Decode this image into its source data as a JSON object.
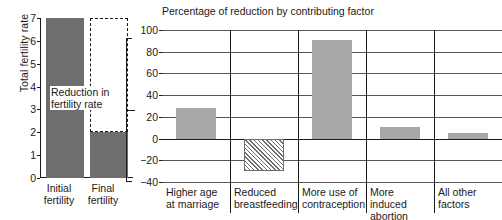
{
  "chart_data": [
    {
      "type": "bar",
      "panel": "left",
      "title": "",
      "xlabel": "",
      "ylabel": "Total fertility rate",
      "categories": [
        "Initial fertility",
        "Final fertility"
      ],
      "category_lines": [
        [
          "Initial",
          "fertility"
        ],
        [
          "Final",
          "fertility"
        ]
      ],
      "values": [
        7,
        2
      ],
      "ylim": [
        0,
        7
      ],
      "yticks": [
        0,
        1,
        2,
        3,
        4,
        5,
        6,
        7
      ],
      "ytick_labels": [
        "0",
        "1",
        "2",
        "3",
        "4",
        "5",
        "6",
        "7"
      ],
      "grid": false,
      "legend": "none",
      "bar_color": "#6e6e6e",
      "annotation": {
        "text": "Reduction in fertility rate",
        "lines": [
          "Reduction in",
          "fertility rate"
        ],
        "style": "dashed-box",
        "from": 2,
        "to": 7
      }
    },
    {
      "type": "bar",
      "panel": "right",
      "title": "Percentage of reduction by contributing factor",
      "xlabel": "",
      "ylabel": "",
      "categories": [
        "Higher age at marriage",
        "Reduced breastfeeding",
        "More use of contraception",
        "More induced abortion",
        "All other factors"
      ],
      "category_lines": [
        [
          "Higher age",
          "at marriage"
        ],
        [
          "Reduced",
          "breastfeeding"
        ],
        [
          "More use of",
          "contraception"
        ],
        [
          "More induced",
          "abortion"
        ],
        [
          "All other",
          "factors"
        ]
      ],
      "values": [
        28,
        -30,
        91,
        11,
        5
      ],
      "ylim": [
        -40,
        100
      ],
      "yticks": [
        -40,
        -20,
        0,
        20,
        40,
        60,
        80,
        100
      ],
      "ytick_labels": [
        "−40",
        "−20",
        "0",
        "20",
        "40",
        "60",
        "80",
        "100"
      ],
      "grid": true,
      "legend": "none",
      "bar_color": "#a8a8a8",
      "negative_bar_style": "hatched"
    }
  ],
  "left": {
    "ylabel": "Total fertility rate",
    "yticks": [
      "7",
      "6",
      "5",
      "4",
      "3",
      "2",
      "1",
      "0"
    ],
    "bars": [
      {
        "name": "initial-fertility",
        "line1": "Initial",
        "line2": "fertility",
        "value": 7
      },
      {
        "name": "final-fertility",
        "line1": "Final",
        "line2": "fertility",
        "value": 2
      }
    ],
    "annotation_line1": "Reduction in",
    "annotation_line2": "fertility rate"
  },
  "right": {
    "title": "Percentage of reduction by contributing factor",
    "yticks": [
      "100",
      "80",
      "60",
      "40",
      "20",
      "0",
      "−20",
      "−40"
    ],
    "bars": [
      {
        "name": "higher-age-at-marriage",
        "line1": "Higher age",
        "line2": "at marriage",
        "value": 28
      },
      {
        "name": "reduced-breastfeeding",
        "line1": "Reduced",
        "line2": "breastfeeding",
        "value": -30
      },
      {
        "name": "more-use-of-contraception",
        "line1": "More use of",
        "line2": "contraception",
        "value": 91
      },
      {
        "name": "more-induced-abortion",
        "line1": "More induced",
        "line2": "abortion",
        "value": 11
      },
      {
        "name": "all-other-factors",
        "line1": "All other",
        "line2": "factors",
        "value": 5
      }
    ]
  },
  "colors": {
    "left_bar": "#6e6e6e",
    "right_bar": "#a8a8a8",
    "axis": "#1a1a1a",
    "grid": "#545454",
    "background": "#ffffff"
  }
}
